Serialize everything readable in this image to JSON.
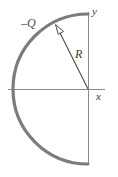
{
  "figure": {
    "type": "physics-diagram",
    "background_color": "#ffffff",
    "width": 118,
    "height": 177,
    "origin": {
      "x": 88,
      "y": 89
    },
    "arc": {
      "name": "semicircular-charge-arc",
      "label": "–Q",
      "radius": 75,
      "stroke_color": "#7c7c7c",
      "stroke_width": 3.2,
      "start_angle_deg": 90,
      "end_angle_deg": 270,
      "start_point": {
        "x": 88,
        "y": 14
      },
      "end_point": {
        "x": 88,
        "y": 164
      },
      "leftmost_point": {
        "x": 13,
        "y": 89
      }
    },
    "axes": {
      "stroke_color": "#8a8a8a",
      "stroke_width": 1,
      "x_axis": {
        "label": "x",
        "from": {
          "x": 8,
          "y": 89
        },
        "to": {
          "x": 105,
          "y": 89
        }
      },
      "y_axis": {
        "label": "y",
        "from": {
          "x": 88,
          "y": 165
        },
        "to": {
          "x": 88,
          "y": 12
        }
      }
    },
    "radius_vector": {
      "name": "radius-arrow",
      "label": "R",
      "from": {
        "x": 88,
        "y": 89
      },
      "to": {
        "x": 56,
        "y": 26
      },
      "stroke_color": "#4a4a4a",
      "stroke_width": 1.1,
      "arrowhead": "open-triangle"
    }
  }
}
